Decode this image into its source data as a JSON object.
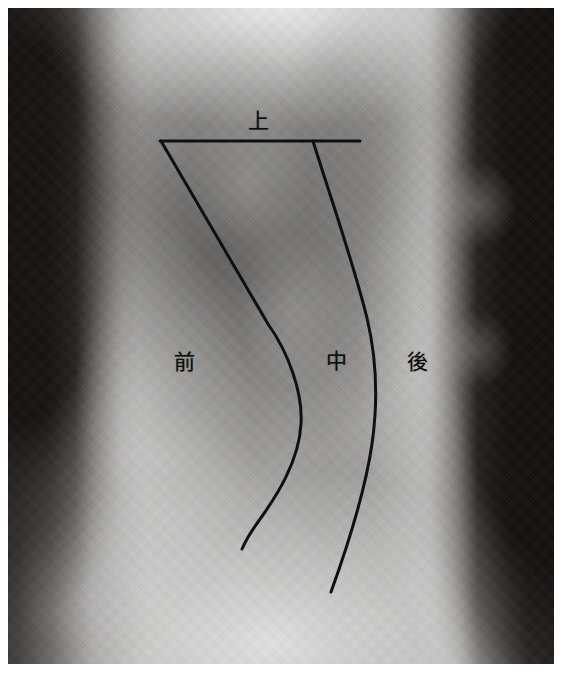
{
  "image": {
    "kind": "radiograph",
    "modality": "lateral chest x-ray",
    "border_color": "#ffffff",
    "plate": {
      "x": 8,
      "y": 8,
      "width": 546,
      "height": 656
    }
  },
  "annotations": {
    "ink_color": "#101010",
    "stroke_width": 3,
    "labels": [
      {
        "id": "upper",
        "text": "上",
        "x": 258,
        "y": 121,
        "meaning": "upper"
      },
      {
        "id": "anterior",
        "text": "前",
        "x": 184,
        "y": 362,
        "meaning": "anterior"
      },
      {
        "id": "middle",
        "text": "中",
        "x": 336,
        "y": 361,
        "meaning": "middle"
      },
      {
        "id": "posterior",
        "text": "後",
        "x": 417,
        "y": 362,
        "meaning": "posterior"
      }
    ],
    "lines": [
      {
        "id": "upper-horizontal-divider",
        "type": "line",
        "d": "M 160 141 L 360 141"
      },
      {
        "id": "anterior-middle-divider",
        "type": "curve",
        "d": "M 161 141 L 268 324 C 288 352 303 392 301 424 C 299 462 276 497 258 522 C 250 533 245 542 242 549"
      },
      {
        "id": "middle-posterior-divider",
        "type": "curve",
        "d": "M 313 141 C 330 196 352 258 367 318 C 377 360 378 402 372 444 C 365 492 348 545 331 592"
      }
    ]
  }
}
